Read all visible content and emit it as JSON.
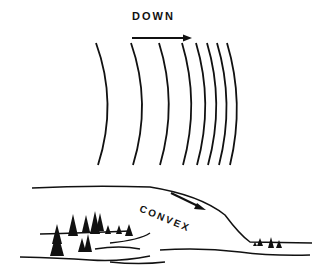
{
  "diagram": {
    "top_label": "DOWN",
    "bottom_label": "CONVEX",
    "contour_lines": {
      "count": 8,
      "description": "curved contour lines spacing closer toward downhill direction",
      "x_positions": [
        96,
        131,
        159,
        182,
        196,
        207,
        217,
        227
      ]
    },
    "arrows": [
      {
        "name": "down-arrow",
        "direction": "right"
      },
      {
        "name": "slope-arrow",
        "direction": "down-right"
      }
    ],
    "colors": {
      "ink": "#111111",
      "background": "#ffffff"
    }
  }
}
